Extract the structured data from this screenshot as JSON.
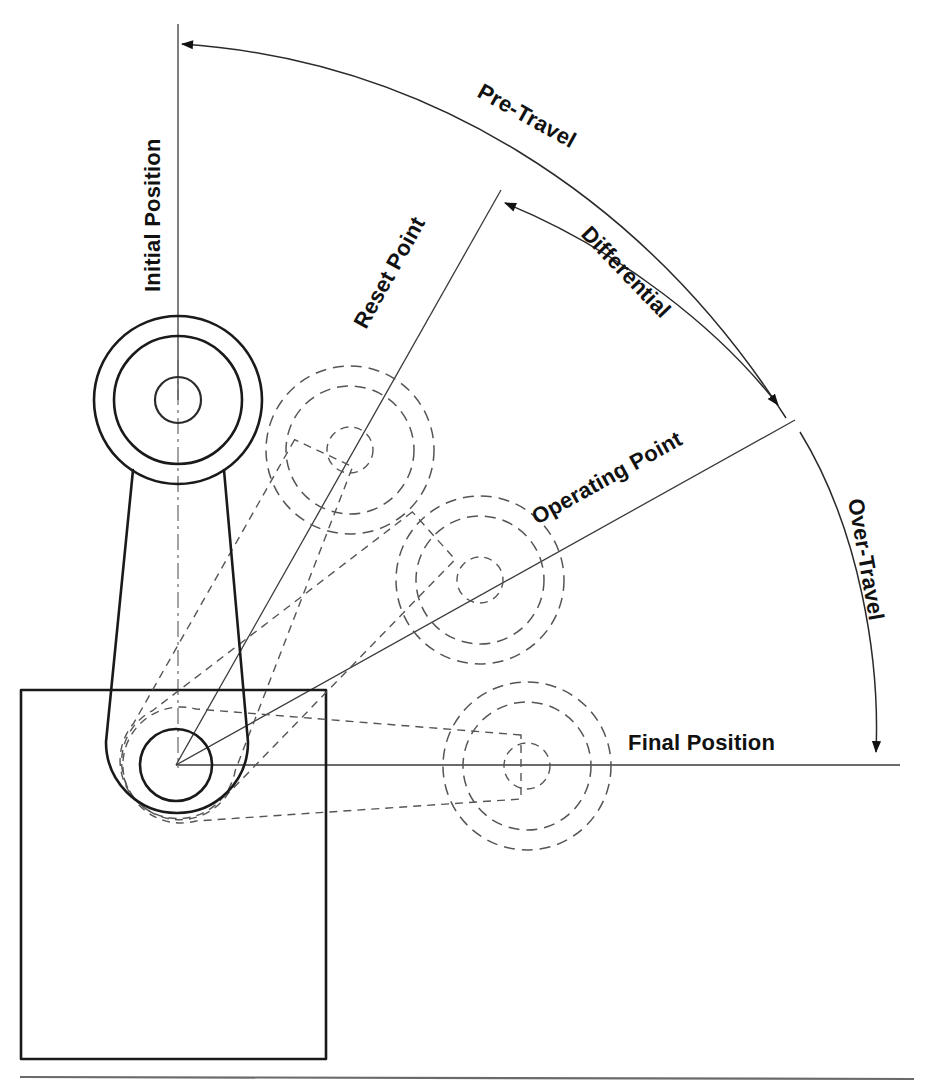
{
  "diagram": {
    "background_color": "#ffffff",
    "line_color": "#1a1a1a",
    "ghost_color": "#555555",
    "labels": {
      "initial_position": "Initial Position",
      "reset_point": "Reset Point",
      "pre_travel": "Pre-Travel",
      "differential": "Differential",
      "operating_point": "Operating Point",
      "over_travel": "Over-Travel",
      "final_position": "Final Position"
    },
    "geometry": {
      "pivot": {
        "x": 176,
        "y": 765,
        "inner_r": 36,
        "outer_r": 72
      },
      "roller_radii": {
        "outer": 84,
        "mid": 64,
        "inner": 23
      },
      "positions": [
        {
          "name": "initial",
          "x": 178,
          "y": 400,
          "style": "solid",
          "angle_deg": 0
        },
        {
          "name": "reset",
          "x": 350,
          "y": 450,
          "style": "ghost",
          "angle_deg": 25
        },
        {
          "name": "operating",
          "x": 480,
          "y": 580,
          "style": "ghost",
          "angle_deg": 48
        },
        {
          "name": "final",
          "x": 527,
          "y": 766,
          "style": "ghost",
          "angle_deg": 90
        }
      ],
      "body_rect": {
        "x": 21,
        "y": 690,
        "w": 305,
        "h": 369
      },
      "baseline_y": 1077,
      "arcs": [
        {
          "name": "pre-travel",
          "radius": 724,
          "start_label": "initial-position-line",
          "end_label": "operating-point-line",
          "arrow_at": "start"
        },
        {
          "name": "differential",
          "radius": 600,
          "start_label": "reset-point-line",
          "end_label": "operating-point-line",
          "arrow_at": "both"
        },
        {
          "name": "over-travel",
          "radius": 700,
          "start_label": "operating-point-line",
          "end_label": "final-position-line",
          "arrow_at": "end"
        }
      ]
    }
  }
}
